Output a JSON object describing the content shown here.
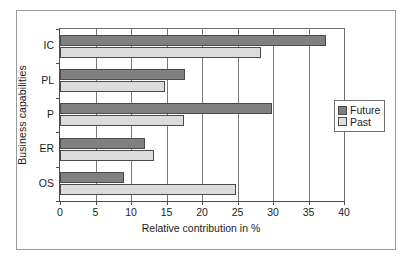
{
  "chart_data": {
    "type": "bar",
    "orientation": "horizontal",
    "title": "",
    "xlabel": "Relative contribution in %",
    "ylabel": "Business capabilities",
    "categories": [
      "IC",
      "PL",
      "P",
      "ER",
      "OS"
    ],
    "xlim": [
      0,
      40
    ],
    "xticks": [
      0,
      5,
      10,
      15,
      20,
      25,
      30,
      35,
      40
    ],
    "xtick_labels": [
      "0",
      "5",
      "10",
      "15",
      "20",
      "25",
      "30",
      "35",
      "40"
    ],
    "grid": "vertical",
    "legend_position": "right",
    "series": [
      {
        "name": "Future",
        "color": "#808080",
        "values": [
          37.5,
          17.6,
          29.9,
          12.0,
          9.0
        ]
      },
      {
        "name": "Past",
        "color": "#dcdcdc",
        "values": [
          28.3,
          14.8,
          17.5,
          13.2,
          24.8
        ]
      }
    ]
  },
  "legend": {
    "items": [
      {
        "label": "Future",
        "swatch": "future"
      },
      {
        "label": "Past",
        "swatch": "past"
      }
    ]
  }
}
